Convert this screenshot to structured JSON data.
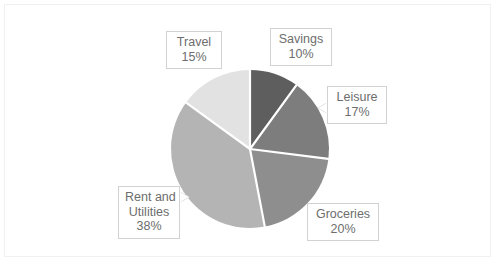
{
  "chart_data": {
    "type": "pie",
    "title": "",
    "subtitle": "",
    "xlabel": "",
    "ylabel": "",
    "grid": false,
    "legend": "none",
    "label_format": "category name and percentage",
    "start_angle_deg": 0,
    "direction": "clockwise",
    "categories": [
      "Savings",
      "Leisure",
      "Groceries",
      "Rent and Utilities",
      "Travel"
    ],
    "values": [
      10,
      17,
      20,
      38,
      15
    ],
    "unit": "%",
    "total": 100,
    "slices": [
      {
        "name": "Savings",
        "value": 10,
        "value_label": "10%",
        "color": "#5e5e5e",
        "label_lines": [
          "Savings",
          "10%"
        ]
      },
      {
        "name": "Leisure",
        "value": 17,
        "value_label": "17%",
        "color": "#7d7d7d",
        "label_lines": [
          "Leisure",
          "17%"
        ]
      },
      {
        "name": "Groceries",
        "value": 20,
        "value_label": "20%",
        "color": "#8e8e8e",
        "label_lines": [
          "Groceries",
          "20%"
        ]
      },
      {
        "name": "Rent and Utilities",
        "value": 38,
        "value_label": "38%",
        "color": "#b4b4b4",
        "label_lines": [
          "Rent and",
          "Utilities",
          "38%"
        ]
      },
      {
        "name": "Travel",
        "value": 15,
        "value_label": "15%",
        "color": "#e2e2e2",
        "label_lines": [
          "Travel",
          "15%"
        ]
      }
    ]
  },
  "labels": {
    "savings": {
      "name": "Savings",
      "value": "10%"
    },
    "leisure": {
      "name": "Leisure",
      "value": "17%"
    },
    "groceries": {
      "name": "Groceries",
      "value": "20%"
    },
    "rent": {
      "name_line1": "Rent and",
      "name_line2": "Utilities",
      "value": "38%"
    },
    "travel": {
      "name": "Travel",
      "value": "15%"
    }
  },
  "style": {
    "background": "#ffffff",
    "frame_border": "#f0f0f0",
    "slice_separator": "#ffffff",
    "label_text": "#6d6d6d",
    "label_border": "#d2d2d2"
  }
}
